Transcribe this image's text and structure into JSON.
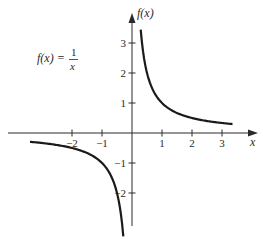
{
  "chart_data": {
    "type": "line",
    "title": "",
    "annotation": {
      "lhs": "f(x) =",
      "numerator": "1",
      "denominator": "x"
    },
    "function": "1/x",
    "xlabel": "x",
    "ylabel": "f(x)",
    "xlim": [
      -4.3,
      4.3
    ],
    "ylim": [
      -3.6,
      4.0
    ],
    "x_ticks": [
      -2,
      -1,
      1,
      2,
      3
    ],
    "x_tick_labels": [
      "−2",
      "−1",
      "1",
      "2",
      "3"
    ],
    "y_ticks": [
      3,
      2,
      1,
      -1,
      -2
    ],
    "y_tick_labels": [
      "3",
      "2",
      "1",
      "−1",
      "−2"
    ],
    "grid": false,
    "legend": "none",
    "series": [
      {
        "name": "f(x) = 1/x (x > 0)",
        "x_range": [
          0.29,
          3.35
        ],
        "x": [
          0.29,
          0.5,
          1,
          1.5,
          2,
          2.5,
          3,
          3.35
        ],
        "y": [
          3.45,
          2.0,
          1.0,
          0.67,
          0.5,
          0.4,
          0.33,
          0.3
        ]
      },
      {
        "name": "f(x) = 1/x (x < 0)",
        "x_range": [
          -3.4,
          -0.29
        ],
        "x": [
          -3.4,
          -3,
          -2.5,
          -2,
          -1.5,
          -1,
          -0.5,
          -0.29
        ],
        "y": [
          -0.29,
          -0.33,
          -0.4,
          -0.5,
          -0.67,
          -1.0,
          -2.0,
          -3.45
        ]
      }
    ],
    "color": "#1a1a1a"
  }
}
